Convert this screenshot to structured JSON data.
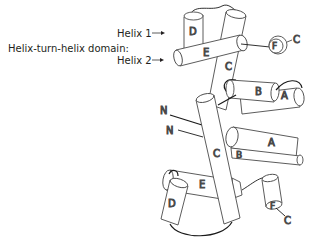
{
  "labels": {
    "domain": "Helix-turn-helix domain:",
    "helix1": "Helix 1",
    "helix2": "Helix 2"
  },
  "upper_subunit": {
    "helices": [
      "D",
      "E",
      "F",
      "C",
      "B",
      "A"
    ],
    "terminus_c": "C",
    "terminus_n": "N"
  },
  "lower_subunit": {
    "helices": [
      "C",
      "A",
      "B",
      "E",
      "D",
      "F"
    ],
    "terminus_c": "C",
    "terminus_n": "N"
  },
  "colors": {
    "stroke": "#4a4a4a",
    "loop": "#1a1a1a",
    "fill": "#ffffff"
  }
}
